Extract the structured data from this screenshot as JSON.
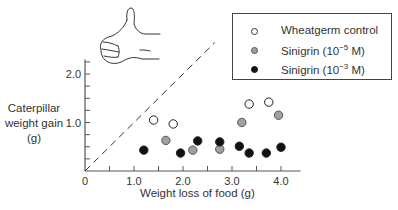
{
  "chart_data": {
    "type": "scatter",
    "title": "",
    "xlabel": "Weight loss of food (g)",
    "ylabel": "Caterpillar weight gain (g)",
    "xlim": [
      0,
      4.4
    ],
    "ylim": [
      0,
      2.3
    ],
    "x_ticks": [
      "0",
      "1.0",
      "2.0",
      "3.0",
      "4.0"
    ],
    "y_ticks": [
      "1.0",
      "2.0"
    ],
    "grid": false,
    "legend_position": "top-right",
    "reference_line": {
      "style": "dashed",
      "label": "y = x",
      "from": [
        0,
        0
      ],
      "to": [
        2.65,
        2.65
      ]
    },
    "annotation": "thumbs-up hand illustration",
    "series": [
      {
        "name": "Wheatgerm control",
        "marker": "open circle",
        "color": "#ffffff",
        "points": [
          [
            1.4,
            1.05
          ],
          [
            1.8,
            0.97
          ],
          [
            3.35,
            1.38
          ],
          [
            3.75,
            1.42
          ]
        ]
      },
      {
        "name": "Sinigrin (10^-5 M)",
        "marker": "gray circle",
        "color": "#a0a0a0",
        "points": [
          [
            1.65,
            0.63
          ],
          [
            2.2,
            0.43
          ],
          [
            2.75,
            0.45
          ],
          [
            3.2,
            1.0
          ],
          [
            3.95,
            1.15
          ]
        ]
      },
      {
        "name": "Sinigrin (10^-3 M)",
        "marker": "filled circle",
        "color": "#111111",
        "points": [
          [
            1.2,
            0.43
          ],
          [
            1.95,
            0.37
          ],
          [
            2.3,
            0.62
          ],
          [
            2.75,
            0.6
          ],
          [
            3.15,
            0.51
          ],
          [
            3.35,
            0.37
          ],
          [
            3.7,
            0.37
          ],
          [
            4.0,
            0.49
          ]
        ]
      }
    ]
  },
  "axes": {
    "y_label_lines": [
      "Caterpillar",
      "weight gain",
      "(g)"
    ],
    "x_label": "Weight loss of food (g)"
  },
  "legend": {
    "items": [
      {
        "label": "Wheatgerm control",
        "fill": "#ffffff"
      },
      {
        "label_base": "Sinigrin (10",
        "label_exp": "−5",
        "label_tail": " M)",
        "fill": "#a0a0a0"
      },
      {
        "label_base": "Sinigrin (10",
        "label_exp": "−3",
        "label_tail": " M)",
        "fill": "#111111"
      }
    ]
  }
}
